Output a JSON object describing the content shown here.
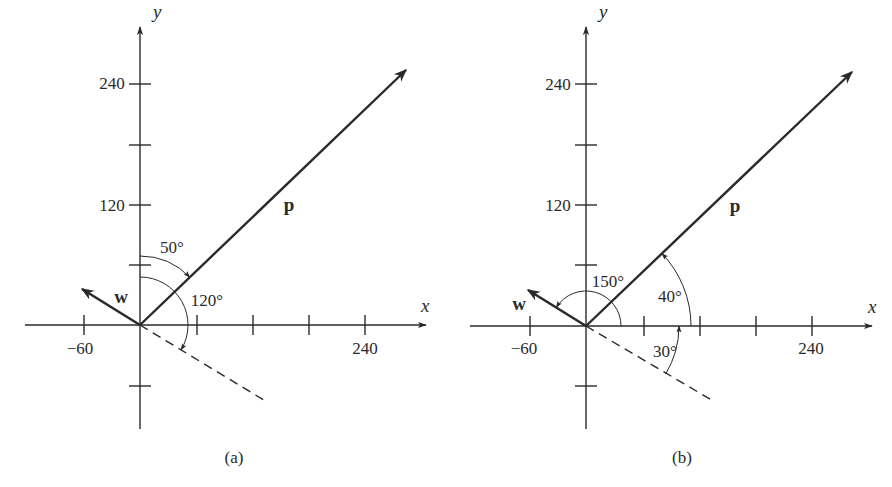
{
  "figure": {
    "colors": {
      "ink": "#2a2a2a",
      "background": "#ffffff"
    },
    "panels": [
      {
        "id": "a",
        "caption": "(a)",
        "origin": [
          140,
          325
        ],
        "x_axis": {
          "name": "x",
          "from": 25,
          "to": 426,
          "name_pos": [
            421,
            312
          ]
        },
        "y_axis": {
          "name": "y",
          "from": 429,
          "to": 27,
          "name_pos": [
            153,
            18
          ]
        },
        "x_ticks": [
          {
            "px": 84,
            "label": "−60",
            "label_pos": [
              80,
              354
            ]
          },
          {
            "px": 197,
            "label": "",
            "label_pos": [
              0,
              0
            ]
          },
          {
            "px": 253,
            "label": "",
            "label_pos": [
              0,
              0
            ]
          },
          {
            "px": 309,
            "label": "",
            "label_pos": [
              0,
              0
            ]
          },
          {
            "px": 365,
            "label": "240",
            "label_pos": [
              365,
              354
            ]
          }
        ],
        "y_ticks": [
          {
            "py": 84,
            "label": "240",
            "label_pos": [
              112,
              89
            ]
          },
          {
            "py": 145,
            "label": "",
            "label_pos": [
              0,
              0
            ]
          },
          {
            "py": 205,
            "label": "120",
            "label_pos": [
              112,
              211
            ]
          },
          {
            "py": 265,
            "label": "",
            "label_pos": [
              0,
              0
            ]
          },
          {
            "py": 386,
            "label": "",
            "label_pos": [
              0,
              0
            ]
          }
        ],
        "vectors": [
          {
            "name": "p",
            "tip": [
              406,
              70
            ],
            "label_pos": [
              289,
              211
            ],
            "width": 2.4
          },
          {
            "name": "w",
            "tip": [
              82,
              289
            ],
            "label_pos": [
              121,
              303
            ],
            "width": 2.6
          }
        ],
        "dashed_line": {
          "end": [
            267,
            402
          ]
        },
        "angle_arcs": [
          {
            "label": "50°",
            "radius": 69,
            "start_deg": 90,
            "end_deg": 43.8,
            "arrow_at": "end",
            "label_pos": [
              172,
              253
            ]
          },
          {
            "label": "120°",
            "radius": 48,
            "start_deg": 90,
            "end_deg": -31.2,
            "arrow_at": "end",
            "label_pos": [
              207,
              306
            ]
          }
        ]
      },
      {
        "id": "b",
        "caption": "(b)",
        "origin": [
          586,
          326
        ],
        "x_axis": {
          "name": "x",
          "from": 470,
          "to": 872,
          "name_pos": [
            868,
            313
          ]
        },
        "y_axis": {
          "name": "y",
          "from": 429,
          "to": 27,
          "name_pos": [
            599,
            18
          ]
        },
        "x_ticks": [
          {
            "px": 530,
            "label": "−60",
            "label_pos": [
              524,
              354
            ]
          },
          {
            "px": 644,
            "label": "",
            "label_pos": [
              0,
              0
            ]
          },
          {
            "px": 700,
            "label": "",
            "label_pos": [
              0,
              0
            ]
          },
          {
            "px": 756,
            "label": "",
            "label_pos": [
              0,
              0
            ]
          },
          {
            "px": 812,
            "label": "240",
            "label_pos": [
              811,
              354
            ]
          }
        ],
        "y_ticks": [
          {
            "py": 84,
            "label": "240",
            "label_pos": [
              558,
              90
            ]
          },
          {
            "py": 145,
            "label": "",
            "label_pos": [
              0,
              0
            ]
          },
          {
            "py": 205,
            "label": "120",
            "label_pos": [
              558,
              211
            ]
          },
          {
            "py": 265,
            "label": "",
            "label_pos": [
              0,
              0
            ]
          },
          {
            "py": 386,
            "label": "",
            "label_pos": [
              0,
              0
            ]
          }
        ],
        "vectors": [
          {
            "name": "p",
            "tip": [
              852,
              72
            ],
            "label_pos": [
              735,
              212
            ],
            "width": 2.4
          },
          {
            "name": "w",
            "tip": [
              528,
              290
            ],
            "label_pos": [
              519,
              310
            ],
            "width": 2.6
          }
        ],
        "dashed_line": {
          "end": [
            715,
            402
          ]
        },
        "angle_arcs": [
          {
            "label": "150°",
            "radius": 35,
            "start_deg": 0,
            "end_deg": 148,
            "arrow_at": "end",
            "label_pos": [
              608,
              287
            ]
          },
          {
            "label": "40°",
            "radius": 105,
            "start_deg": 0,
            "end_deg": 43.7,
            "arrow_at": "end",
            "label_pos": [
              670,
              302
            ]
          },
          {
            "label": "30°",
            "radius": 93,
            "start_deg": -31.2,
            "end_deg": 0,
            "arrow_at": "end",
            "label_pos": [
              665,
              357
            ]
          }
        ]
      }
    ],
    "caption_positions": {
      "a": [
        234,
        463
      ],
      "b": [
        682,
        463
      ]
    }
  }
}
